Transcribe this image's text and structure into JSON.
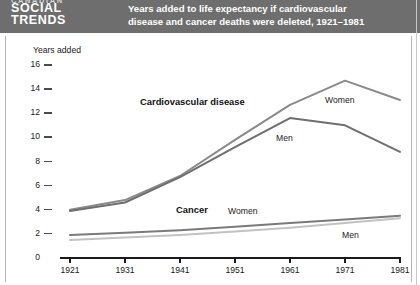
{
  "header": {
    "kicker": "CANADIAN",
    "masthead_line1": "SOCIAL",
    "masthead_line2": "TRENDS",
    "title_line1": "Years added to life expectancy if cardiovascular",
    "title_line2": "disease and cancer deaths were deleted, 1921–1981",
    "band_color": "#6e6e6e",
    "text_color": "#ffffff"
  },
  "chart_data": {
    "type": "line",
    "title": "Years added to life expectancy if cardiovascular disease and cancer deaths were deleted, 1921–1981",
    "xlabel": "",
    "ylabel": "Years added",
    "x": [
      1921,
      1931,
      1941,
      1951,
      1961,
      1971,
      1981
    ],
    "xtick_labels": [
      "1921",
      "1931",
      "1941",
      "1951",
      "1961",
      "1971",
      "1981"
    ],
    "ytick_labels": [
      "0",
      "2",
      "4",
      "6",
      "8",
      "10",
      "12",
      "14",
      "16"
    ],
    "yticks": [
      0,
      2,
      4,
      6,
      8,
      10,
      12,
      14,
      16
    ],
    "ylim": [
      0,
      16
    ],
    "xlim": [
      1921,
      1981
    ],
    "grid": false,
    "legend_position": "inline-annotations",
    "series": [
      {
        "name": "Cardiovascular disease – Women",
        "group": "Cardiovascular disease",
        "sex": "Women",
        "color": "#8a8a8a",
        "values": [
          4.0,
          4.8,
          6.8,
          9.8,
          12.7,
          14.7,
          13.1
        ]
      },
      {
        "name": "Cardiovascular disease – Men",
        "group": "Cardiovascular disease",
        "sex": "Men",
        "color": "#6f6f6f",
        "values": [
          3.9,
          4.6,
          6.7,
          9.2,
          11.6,
          11.0,
          8.8
        ]
      },
      {
        "name": "Cancer – Women",
        "group": "Cancer",
        "sex": "Women",
        "color": "#7a7a7a",
        "values": [
          1.9,
          2.1,
          2.3,
          2.6,
          2.9,
          3.2,
          3.5
        ]
      },
      {
        "name": "Cancer – Men",
        "group": "Cancer",
        "sex": "Men",
        "color": "#c2c2c2",
        "values": [
          1.5,
          1.7,
          1.9,
          2.2,
          2.5,
          2.9,
          3.3
        ]
      }
    ],
    "annotations": [
      {
        "text": "Cardiovascular disease",
        "kind": "group",
        "x": 140,
        "y": 96
      },
      {
        "text": "Women",
        "kind": "series",
        "x": 325,
        "y": 95
      },
      {
        "text": "Men",
        "kind": "series",
        "x": 276,
        "y": 133
      },
      {
        "text": "Cancer",
        "kind": "group",
        "x": 176,
        "y": 204
      },
      {
        "text": "Women",
        "kind": "series",
        "x": 228,
        "y": 206
      },
      {
        "text": "Men",
        "kind": "series",
        "x": 342,
        "y": 230
      }
    ]
  }
}
